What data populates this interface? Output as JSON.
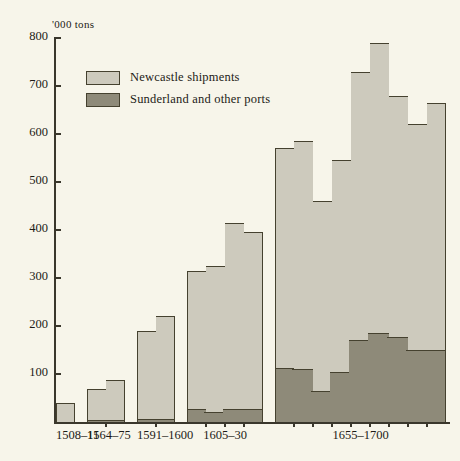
{
  "chart_data": {
    "type": "bar",
    "title": "",
    "subtitle": "",
    "xlabel": "",
    "ylabel": "'000 tons",
    "ylim": [
      0,
      800
    ],
    "yticks": [
      0,
      100,
      200,
      300,
      400,
      500,
      600,
      700,
      800
    ],
    "ytick_labels": [
      "",
      "100",
      "200",
      "300",
      "400",
      "500",
      "600",
      "700",
      "800"
    ],
    "grid": false,
    "legend_position": "upper-left",
    "stacked": true,
    "series": [
      {
        "name": "Newcastle shipments",
        "color": "#cdcabd"
      },
      {
        "name": "Sunderland and other ports",
        "color": "#8e8a79"
      }
    ],
    "categories": [
      "1508–11",
      "1564–75",
      "1591–1600",
      "1605–30",
      "1655–1700"
    ],
    "groups": [
      {
        "label": "1508–11",
        "bars": [
          {
            "total": 40,
            "sunderland": 0
          }
        ]
      },
      {
        "label": "1564–75",
        "bars": [
          {
            "total": 68,
            "sunderland": 5
          },
          {
            "total": 88,
            "sunderland": 5
          }
        ]
      },
      {
        "label": "1591–1600",
        "bars": [
          {
            "total": 190,
            "sunderland": 6
          },
          {
            "total": 220,
            "sunderland": 6
          }
        ]
      },
      {
        "label": "1605–30",
        "bars": [
          {
            "total": 315,
            "sunderland": 28
          },
          {
            "total": 325,
            "sunderland": 20
          },
          {
            "total": 415,
            "sunderland": 28
          },
          {
            "total": 395,
            "sunderland": 28
          }
        ]
      },
      {
        "label": "1655–1700",
        "bars": [
          {
            "total": 570,
            "sunderland": 112
          },
          {
            "total": 585,
            "sunderland": 110
          },
          {
            "total": 460,
            "sunderland": 65
          },
          {
            "total": 545,
            "sunderland": 105
          },
          {
            "total": 730,
            "sunderland": 170
          },
          {
            "total": 790,
            "sunderland": 185
          },
          {
            "total": 680,
            "sunderland": 178
          },
          {
            "total": 620,
            "sunderland": 150
          },
          {
            "total": 665,
            "sunderland": 150
          }
        ]
      }
    ]
  },
  "legend": {
    "items": [
      {
        "label": "Newcastle shipments",
        "swatch": "light"
      },
      {
        "label": "Sunderland and other ports",
        "swatch": "dark"
      }
    ]
  },
  "axis": {
    "unit_label": "'000 tons"
  }
}
